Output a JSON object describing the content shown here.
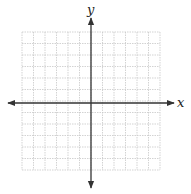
{
  "diagram": {
    "type": "coordinate-grid",
    "x_axis_label": "x",
    "y_axis_label": "y",
    "grid": {
      "columns": 12,
      "rows": 12,
      "left": 22,
      "top": 32,
      "cell": 11.5
    },
    "origin_px": {
      "x": 91,
      "y": 103
    },
    "colors": {
      "grid": "#c8c8c8",
      "axis": "#333333",
      "background": "#ffffff"
    }
  }
}
